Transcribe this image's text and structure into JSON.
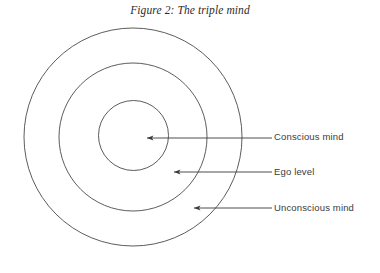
{
  "figure": {
    "title": "Figure 2: The triple mind",
    "background_color": "#ffffff",
    "stroke_color": "#4a4a4a",
    "arrow_color": "#3a3a3a",
    "text_color": "#3a3a3a"
  },
  "diagram": {
    "type": "concentric-circles",
    "center": {
      "x": 133,
      "y": 137
    },
    "rings": [
      {
        "name": "outer-circle",
        "label": "Unconscious mind",
        "radius": 109
      },
      {
        "name": "middle-circle",
        "label": "Ego level",
        "radius": 74
      },
      {
        "name": "inner-circle",
        "label": "Conscious mind",
        "radius": 35
      }
    ],
    "arrows": [
      {
        "name": "arrow-conscious",
        "target": "inner-circle",
        "tip_x": 145,
        "tail_x": 272,
        "y": 138
      },
      {
        "name": "arrow-ego",
        "target": "middle-circle",
        "tip_x": 172,
        "tail_x": 272,
        "y": 172
      },
      {
        "name": "arrow-unconscious",
        "target": "outer-circle",
        "tip_x": 192,
        "tail_x": 272,
        "y": 208
      }
    ]
  },
  "labels": {
    "conscious": "Conscious mind",
    "ego": "Ego level",
    "unconscious": "Unconscious mind"
  }
}
